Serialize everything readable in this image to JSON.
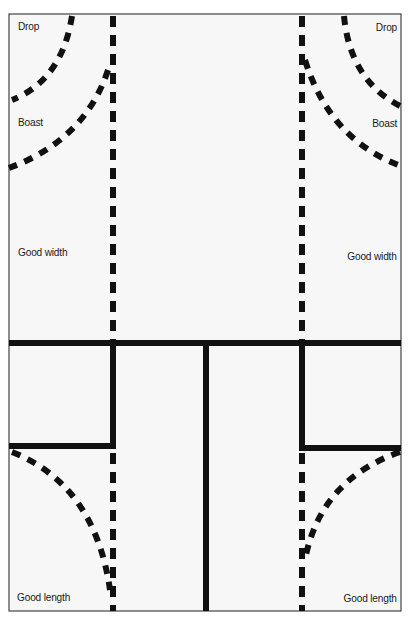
{
  "diagram": {
    "type": "squash-court-target-zones",
    "colors": {
      "background": "#ffffff",
      "court_fill": "#f7f7f7",
      "lines": "#111111",
      "border": "#444444",
      "text": "#1a1a1a"
    },
    "labels": {
      "drop_left": "Drop",
      "drop_right": "Drop",
      "boast_left": "Boast",
      "boast_right": "Boast",
      "good_width_left": "Good width",
      "good_width_right": "Good width",
      "good_length_left": "Good length",
      "good_length_right": "Good length"
    },
    "court_lines": [
      "short-line",
      "half-court-line",
      "left-service-box",
      "right-service-box"
    ],
    "shot_paths": [
      "drop-left",
      "boast-left",
      "good-width-left",
      "good-length-left",
      "drop-right",
      "boast-right",
      "good-width-right",
      "good-length-right"
    ]
  }
}
